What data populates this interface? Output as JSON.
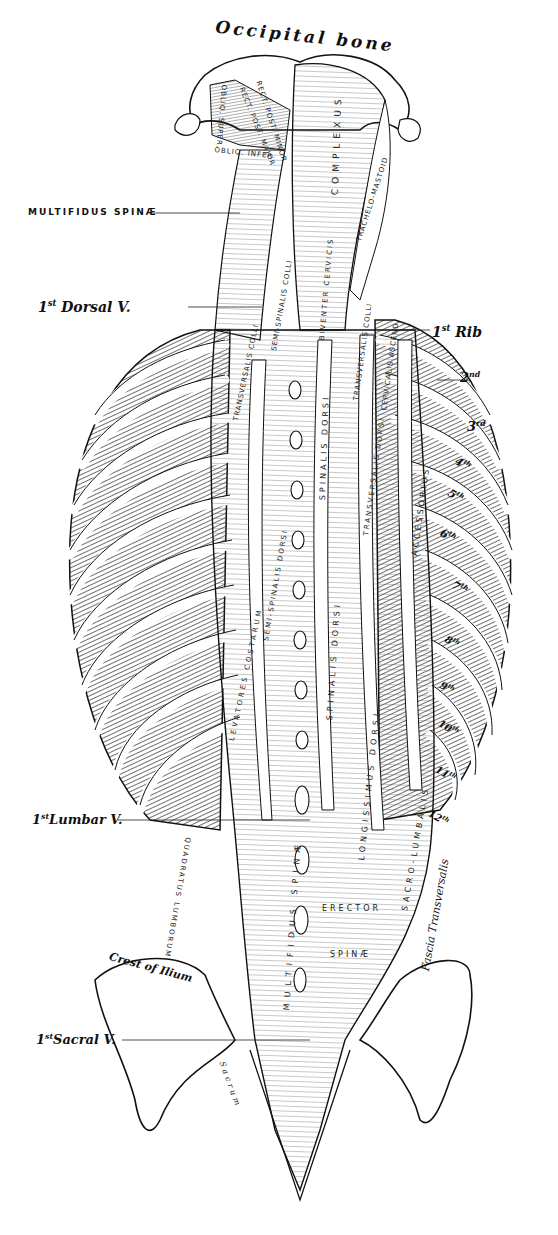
{
  "figure": {
    "colors": {
      "ink": "#111111",
      "paper": "#ffffff"
    }
  },
  "labels": {
    "occipital_bone": "Occipital bone",
    "multifidus_spinae": "MULTIFIDUS SPINÆ",
    "first_dorsal": {
      "num": "1",
      "sup": "st",
      "text": "Dorsal V."
    },
    "first_rib": {
      "num": "1",
      "sup": "st",
      "text": "Rib"
    },
    "first_lumbar": {
      "num": "1",
      "sup": "st",
      "text": "Lumbar V."
    },
    "first_sacral": {
      "num": "1",
      "sup": "st",
      "text": "Sacral V."
    },
    "crest_of_ilium": "Crest of Ilium",
    "fascia_transversalis": "Fascia Transversalis"
  },
  "ribs": [
    {
      "num": "2",
      "sup": "nd"
    },
    {
      "num": "3",
      "sup": "rd"
    },
    {
      "num": "4",
      "sup": "th"
    },
    {
      "num": "5",
      "sup": "th"
    },
    {
      "num": "6",
      "sup": "th"
    },
    {
      "num": "7",
      "sup": "th"
    },
    {
      "num": "8",
      "sup": "th"
    },
    {
      "num": "9",
      "sup": "th"
    },
    {
      "num": "10",
      "sup": "th"
    },
    {
      "num": "11",
      "sup": "th"
    },
    {
      "num": "12",
      "sup": "th"
    }
  ],
  "muscles": {
    "oblique_superior": "OBLIQ. SUPER.",
    "rect_post_major": "RECT. POST. MAJOR",
    "rect_post_minor": "RECT. POST. MINOR",
    "oblique_inferior": "OBLIQ. INFER.",
    "complexus": "COMPLEXUS",
    "trachelo_mastoid": "TRACHELO-MASTOID",
    "biventer_cervicis": "BIVENTER CERVICIS",
    "semi_spinalis_colli": "SEMI-SPINALIS COLLI",
    "transversalis_colli_left": "TRANSVERSALIS COLLI",
    "transversalis_colli_right": "TRANSVERSALIS COLLI",
    "cervicalis_ascendens": "CERVICALIS ASCEND.",
    "transversalis_dorsi_left": "TRANSVERSALIS DORSI",
    "transversalis_dorsi_right": "TRANSVERSALIS DORSI",
    "levatores_costarum": "LEVATORES COSTARUM",
    "semi_spinalis_dorsi": "SEMI-SPINALIS DORSI",
    "spinalis_dorsi_upper": "SPINALIS DORSI",
    "spinalis_dorsi": "SPINALIS DORSI",
    "longissimus_dorsi": "LONGISSIMUS DORSI",
    "accessorius": "ACCESSORIUS",
    "sacro_lumbalis": "SACRO-LUMBALIS",
    "multifidus_spinae_lower": "MULTIFIDUS SPINÆ",
    "quadratus_lumborum": "QUADRATUS LUMBORUM",
    "erector": "ERECTOR",
    "spinae": "SPINÆ",
    "sacrum": "Sacrum"
  }
}
